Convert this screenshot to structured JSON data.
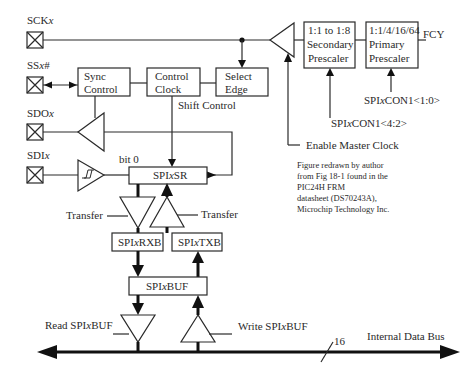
{
  "diagram": {
    "pins": {
      "sck": {
        "label": "SCK",
        "suffix": "x"
      },
      "ss": {
        "label": "SS",
        "suffix": "x",
        "tail": "#"
      },
      "sdo": {
        "label": "SDO",
        "suffix": "x"
      },
      "sdi": {
        "label": "SDI",
        "suffix": "x"
      }
    },
    "blocks": {
      "sync_control": {
        "line1": "Sync",
        "line2": "Control"
      },
      "control_clock": {
        "line1": "Control",
        "line2": "Clock"
      },
      "select_edge": {
        "line1": "Select",
        "line2": "Edge"
      },
      "secondary_prescaler": {
        "line1": "1:1 to 1:8",
        "line2": "Secondary",
        "line3": "Prescaler"
      },
      "primary_prescaler": {
        "line1": "1:1/4/16/64",
        "line2": "Primary",
        "line3": "Prescaler"
      },
      "spixsr": {
        "prefix": "SPI",
        "x": "x",
        "suffix": "SR"
      },
      "spixrxb": {
        "prefix": "SPI",
        "x": "x",
        "suffix": "RXB"
      },
      "spixtxb": {
        "prefix": "SPI",
        "x": "x",
        "suffix": "TXB"
      },
      "spixbuf": {
        "prefix": "SPI",
        "x": "x",
        "suffix": "BUF"
      }
    },
    "labels": {
      "fcy": "FCY",
      "shift_control": "Shift Control",
      "bit0": "bit 0",
      "transfer_left": "Transfer",
      "transfer_right": "Transfer",
      "spixcon1_10": "SPIxCON1<1:0>",
      "spixcon1_42": "SPIxCON1<4:2>",
      "enable_master_clock": "Enable Master Clock",
      "read_spixbuf": "Read SPIxBUF",
      "write_spixbuf": "Write SPIxBUF",
      "bus_width": "16",
      "internal_data_bus": "Internal Data Bus"
    },
    "note": {
      "line1": "Figure redrawn by author",
      "line2": "from Fig 18-1 found in the",
      "line3": "PIC24H FRM",
      "line4": "datasheet (DS70243A),",
      "line5": "Microchip Technology Inc."
    }
  }
}
